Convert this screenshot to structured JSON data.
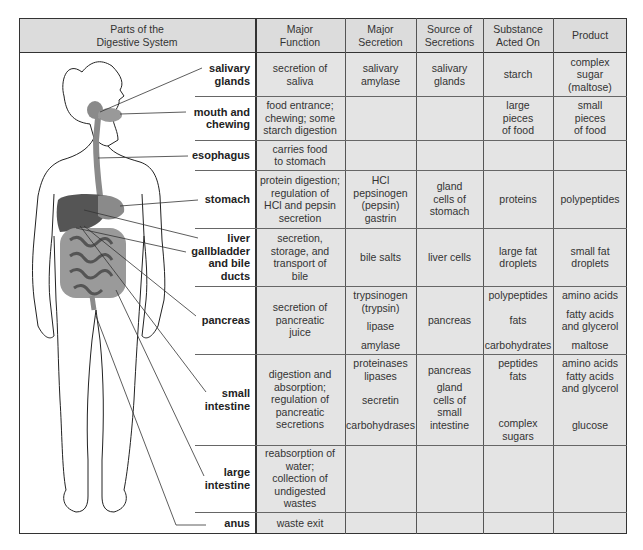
{
  "header": {
    "parts": "Parts of the\nDigestive System",
    "columns": [
      "Major\nFunction",
      "Major\nSecretion",
      "Source of\nSecretions",
      "Substance\nActed On",
      "Product"
    ]
  },
  "rows": [
    {
      "part": "salivary\nglands",
      "function": "secretion of\nsaliva",
      "secretion": "salivary\namylase",
      "source": "salivary\nglands",
      "substance": "starch",
      "product": "complex\nsugar\n(maltose)"
    },
    {
      "part": "mouth and\nchewing",
      "function": "food entrance;\nchewing; some\nstarch digestion",
      "secretion": "",
      "source": "",
      "substance": "large\npieces\nof food",
      "product": "small\npieces\nof food"
    },
    {
      "part": "esophagus",
      "function": "carries food\nto stomach",
      "secretion": "",
      "source": "",
      "substance": "",
      "product": ""
    },
    {
      "part": "stomach",
      "function": "protein digestion;\nregulation of\nHCl and pepsin\nsecretion",
      "secretion": "HCl\npepsinogen\n(pepsin)\ngastrin",
      "source": "gland\ncells of\nstomach",
      "substance": "proteins",
      "product": "polypeptides"
    },
    {
      "part": "liver\ngallbladder\nand bile\nducts",
      "function": "secretion,\nstorage, and\ntransport of\nbile",
      "secretion": "bile salts",
      "source": "liver cells",
      "substance": "large fat\ndroplets",
      "product": "small fat\ndroplets"
    },
    {
      "part": "pancreas",
      "function": "secretion of\npancreatic\njuice",
      "secretion_items": [
        "trypsinogen\n(trypsin)",
        "lipase",
        "",
        "amylase"
      ],
      "source": "pancreas",
      "substance_items": [
        "polypeptides",
        "fats",
        "carbohydrates"
      ],
      "product_items": [
        "amino acids",
        "fatty acids\nand glycerol",
        "maltose"
      ]
    },
    {
      "part": "small\nintestine",
      "function": "digestion and\nabsorption;\nregulation of\npancreatic\nsecretions",
      "secretion_items": [
        "proteinases\nlipases",
        "secretin",
        "carbohydrases"
      ],
      "source_items": [
        "pancreas",
        "gland\ncells of\nsmall\nintestine"
      ],
      "substance_items": [
        "peptides\nfats",
        "complex\nsugars"
      ],
      "product_items": [
        "amino acids\nfatty acids\nand glycerol",
        "glucose"
      ]
    },
    {
      "part": "large\nintestine",
      "function": "reabsorption of\nwater;\ncollection of\nundigested\nwastes",
      "secretion": "",
      "source": "",
      "substance": "",
      "product": ""
    },
    {
      "part": "anus",
      "function": "waste exit",
      "secretion": "",
      "source": "",
      "substance": "",
      "product": ""
    }
  ],
  "colors": {
    "header_bg": "#dcdcdc",
    "cell_bg": "#e4e4e4",
    "border": "#333333",
    "organ": "#7a7a7a"
  }
}
